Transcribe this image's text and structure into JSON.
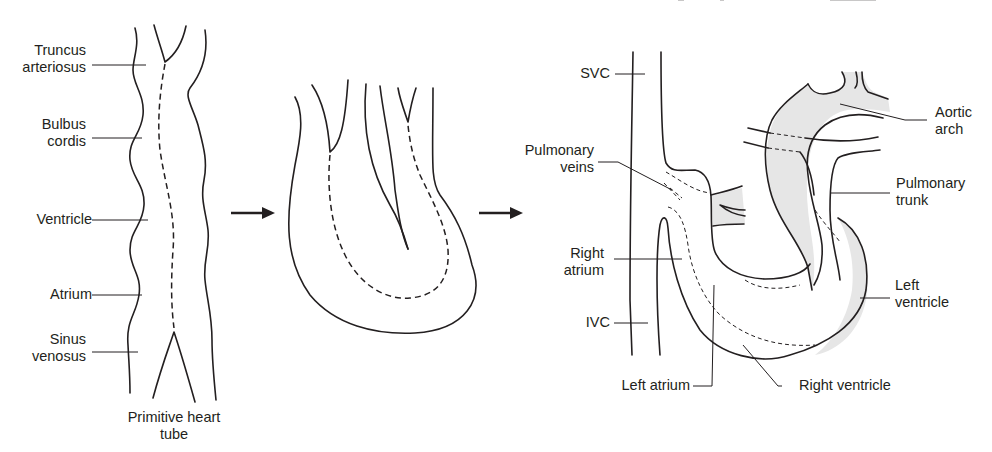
{
  "figure": {
    "panels": [
      {
        "id": "primitive-heart-tube",
        "caption_line1": "Primitive heart",
        "caption_line2": "tube",
        "labels": {
          "truncus_1": "Truncus",
          "truncus_2": "arteriosus",
          "bulbus_1": "Bulbus",
          "bulbus_2": "cordis",
          "ventricle": "Ventricle",
          "atrium": "Atrium",
          "sinus_1": "Sinus",
          "sinus_2": "venosus"
        }
      },
      {
        "id": "looping-heart-tube",
        "labels": {}
      },
      {
        "id": "mature-heart",
        "labels": {
          "svc": "SVC",
          "pulm_veins_1": "Pulmonary",
          "pulm_veins_2": "veins",
          "right_atrium_1": "Right",
          "right_atrium_2": "atrium",
          "ivc": "IVC",
          "left_atrium": "Left atrium",
          "right_ventricle": "Right ventricle",
          "left_ventricle_1": "Left",
          "left_ventricle_2": "ventricle",
          "pulm_trunk_1": "Pulmonary",
          "pulm_trunk_2": "trunk",
          "aortic_arch_1": "Aortic",
          "aortic_arch_2": "arch"
        }
      }
    ],
    "arrows": [
      "right-arrow",
      "right-arrow"
    ],
    "colors": {
      "line": "#231f20",
      "shade": "#e6e6e6",
      "background": "#ffffff"
    }
  }
}
